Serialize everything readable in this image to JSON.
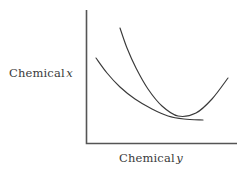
{
  "figure": {
    "background_color": "#ffffff",
    "line_color": "#3a3a3a",
    "axis_color": "#555555"
  },
  "labels": {
    "y_axis": {
      "text": "Chemical",
      "variable": "x",
      "name": "chemical-x-label"
    },
    "x_axis": {
      "text": "Chemical",
      "variable": "y",
      "name": "chemical-y-label"
    }
  },
  "chart_data": {
    "type": "line",
    "title": "",
    "xlabel": "Chemical y",
    "ylabel": "Chemical x",
    "grid": false,
    "legend": null,
    "axis": {
      "origin": [
        86,
        143
      ],
      "y_axis_top": [
        86,
        10
      ],
      "x_axis_right": [
        237,
        143
      ],
      "ticks": [],
      "tick_labels": []
    },
    "series": [
      {
        "name": "isoquant-upper",
        "description": "Steeper convex curve starting high on the left, reaching a minimum and rising to the right",
        "color": "#3a3a3a",
        "points": [
          [
            120,
            28
          ],
          [
            127,
            48
          ],
          [
            136,
            68
          ],
          [
            148,
            89
          ],
          [
            162,
            106
          ],
          [
            178,
            116
          ],
          [
            196,
            113
          ],
          [
            212,
            99
          ],
          [
            228,
            78
          ]
        ]
      },
      {
        "name": "isoquant-lower",
        "description": "Flatter convex curve starting lower on the left, descending and leveling off to the right",
        "color": "#3a3a3a",
        "points": [
          [
            96,
            58
          ],
          [
            107,
            73
          ],
          [
            120,
            87
          ],
          [
            135,
            99
          ],
          [
            152,
            109
          ],
          [
            168,
            116
          ],
          [
            184,
            119
          ],
          [
            203,
            120
          ]
        ]
      }
    ],
    "annotations": [
      {
        "name": "curve-intersection",
        "x": 165,
        "y": 114,
        "label": ""
      }
    ]
  }
}
